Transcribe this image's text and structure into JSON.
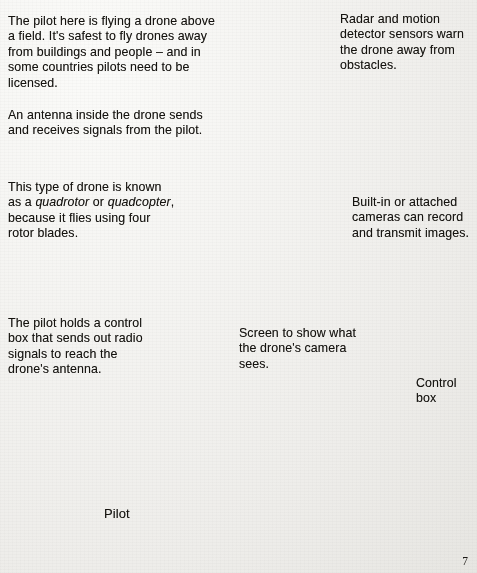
{
  "page": {
    "number": "7",
    "background_color": "#f3f2ef",
    "ground_color": "#9a9a96",
    "ink_color": "#15130f"
  },
  "annotations": {
    "intro": "The pilot here is flying a drone above a field. It's safest to fly drones away from buildings and people – and in some countries pilots need to be licensed.",
    "antenna": "An antenna inside the drone sends and receives signals from the pilot.",
    "quadrotor_pre": "This type of drone is known as a ",
    "quadrotor_italic_1": "quadrotor",
    "quadrotor_mid": " or ",
    "quadrotor_italic_2": "quadcopter",
    "quadrotor_post": ", because it flies using four rotor blades.",
    "pilot_holds": "The pilot holds a control box that sends out radio signals to reach the drone's antenna.",
    "radar": "Radar and motion detector sensors warn the drone away from obstacles.",
    "cameras": "Built-in or attached cameras can record and transmit images.",
    "screen": "Screen to show what the drone's camera sees.",
    "control_box": "Control box",
    "pilot_label": "Pilot"
  },
  "illustration": {
    "drone_body_label": "UAV",
    "controller_body_label": "UAV",
    "scene": "A pilot stands on a field holding a radio control box; a quadrotor drone flies above; a magnified circle shows the control box with a smartphone screen mounted on it; curved radio-wave arcs travel from the pilot to the drone."
  }
}
